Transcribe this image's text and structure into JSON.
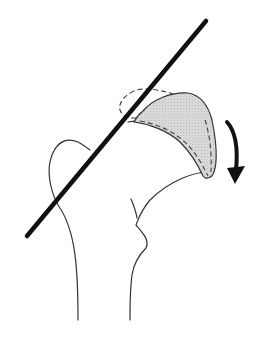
{
  "diagram": {
    "elements": [
      {
        "name": "femur-outline",
        "style": "thin solid line"
      },
      {
        "name": "reference-line",
        "style": "thick solid black line",
        "from": [
          27,
          236
        ],
        "to": [
          206,
          21
        ]
      },
      {
        "name": "displaced-epiphysis",
        "style": "gray stippled fill with solid outline"
      },
      {
        "name": "original-epiphysis-position",
        "style": "dashed outline"
      },
      {
        "name": "slip-direction-arrow",
        "style": "curved thick arrow pointing down"
      }
    ],
    "colors": {
      "line": "#111111",
      "outline": "#333333",
      "fill": "#d9d9d9",
      "background": "#ffffff"
    }
  }
}
